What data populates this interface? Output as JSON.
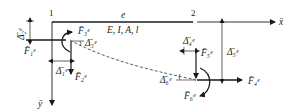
{
  "diagram": {
    "type": "beam-element-deformation",
    "nodes": [
      {
        "id": "node-1",
        "label": "1"
      },
      {
        "id": "node-2",
        "label": "2"
      }
    ],
    "element_label": "e",
    "properties_label": "E, I, A, l",
    "axes": {
      "x": "x̄",
      "y": "ȳ"
    },
    "forces": {
      "F1": "F̄₁ᵉ",
      "F2": "F̄₂ᵉ",
      "F3": "F̄₃ᵉ",
      "F4": "F̄₄ᵉ",
      "F5": "F̄₅ᵉ",
      "F6": "F̄₆ᵉ"
    },
    "displacements": {
      "D1": "Δ̄₁ᵉ",
      "D2": "Δ̄₂ᵉ",
      "D3": "Δ̄₃ᵉ",
      "D4": "Δ̄₄ᵉ",
      "D5": "Δ̄₅ᵉ",
      "D6": "Δ̄₆ᵉ"
    },
    "colors": {
      "line": "#1a1a1a",
      "background": "#ffffff"
    }
  }
}
